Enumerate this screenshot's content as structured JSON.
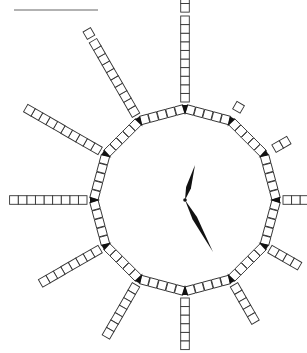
{
  "diagram": {
    "type": "counting-clock",
    "top_rule": {
      "x1": 14,
      "x2": 98,
      "y": 10,
      "color": "#666666"
    },
    "center": {
      "x": 185,
      "y": 200
    },
    "ring_radius": 88,
    "square_size": 8.6,
    "ring_segment_squares": 5,
    "colors": {
      "stroke": "#333333",
      "fill": "#ffffff",
      "hands": "#111111",
      "markers": "#111111"
    },
    "spokes": [
      {
        "hour": 12,
        "squares": 12,
        "groups": [
          10,
          2
        ],
        "note": "10 squares, gap, then 2 more (cut off at top)"
      },
      {
        "hour": 1,
        "squares": 1,
        "groups": [
          0,
          1
        ]
      },
      {
        "hour": 2,
        "squares": 2,
        "groups": [
          0,
          2
        ]
      },
      {
        "hour": 3,
        "squares": 3,
        "groups": [
          3
        ]
      },
      {
        "hour": 4,
        "squares": 4,
        "groups": [
          4
        ]
      },
      {
        "hour": 5,
        "squares": 5,
        "groups": [
          5
        ]
      },
      {
        "hour": 6,
        "squares": 6,
        "groups": [
          6
        ]
      },
      {
        "hour": 7,
        "squares": 7,
        "groups": [
          7
        ]
      },
      {
        "hour": 8,
        "squares": 8,
        "groups": [
          8
        ]
      },
      {
        "hour": 9,
        "squares": 9,
        "groups": [
          9
        ]
      },
      {
        "hour": 10,
        "squares": 10,
        "groups": [
          10
        ]
      },
      {
        "hour": 11,
        "squares": 11,
        "groups": [
          10,
          1
        ]
      }
    ],
    "hands": {
      "hour_hand": {
        "tip": {
          "x": 195,
          "y": 165
        },
        "width": 5
      },
      "minute_hand": {
        "tip": {
          "x": 213,
          "y": 252
        },
        "width": 5
      }
    }
  }
}
